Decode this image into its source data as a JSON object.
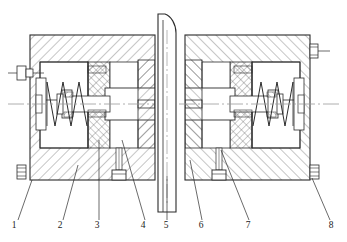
{
  "drawing": {
    "type": "mechanical-cross-section",
    "title": "",
    "width": 347,
    "height": 242,
    "background_color": "#ffffff",
    "line_color": "#2b2b2b",
    "hatch_color": "#555555",
    "centerline_color": "#9a9a9a",
    "description": "Symmetric double-acting clamping/brake mechanism cross-section with central vertical shaft, two mirrored spring-loaded piston assemblies inside a hatched housing body, corner bolt fasteners and bottom screw fasteners.",
    "symmetry": "left-right mirrored about vertical shaft",
    "body": {
      "left_block": {
        "x": 30,
        "y": 35,
        "width": 125,
        "height": 145
      },
      "right_block": {
        "x": 185,
        "y": 35,
        "width": 125,
        "height": 145
      }
    },
    "shaft": {
      "name": "central-vertical-shaft",
      "x_left": 157,
      "x_right": 176,
      "y_top": 14,
      "y_bottom": 212
    },
    "centerline": {
      "name": "horizontal-axis-centerline",
      "y": 104,
      "x_start": 8,
      "x_end": 339
    }
  },
  "callouts": [
    {
      "id": "1",
      "label": "1",
      "label_x": 14,
      "label_y": 228,
      "leader_from_x": 18,
      "leader_from_y": 220,
      "leader_to_x": 32,
      "leader_to_y": 180
    },
    {
      "id": "2",
      "label": "2",
      "label_x": 60,
      "label_y": 228,
      "leader_from_x": 63,
      "leader_from_y": 220,
      "leader_to_x": 78,
      "leader_to_y": 165
    },
    {
      "id": "3",
      "label": "3",
      "label_x": 97,
      "label_y": 228,
      "leader_from_x": 99,
      "leader_from_y": 220,
      "leader_to_x": 99,
      "leader_to_y": 140
    },
    {
      "id": "4",
      "label": "4",
      "label_x": 143,
      "label_y": 228,
      "leader_from_x": 145,
      "leader_from_y": 220,
      "leader_to_x": 122,
      "leader_to_y": 140
    },
    {
      "id": "5",
      "label": "5",
      "label_x": 166,
      "label_y": 228,
      "leader_from_x": 167,
      "leader_from_y": 220,
      "leader_to_x": 167,
      "leader_to_y": 176
    },
    {
      "id": "6",
      "label": "6",
      "label_x": 201,
      "label_y": 228,
      "leader_from_x": 202,
      "leader_from_y": 220,
      "leader_to_x": 190,
      "leader_to_y": 160
    },
    {
      "id": "7",
      "label": "7",
      "label_x": 248,
      "label_y": 228,
      "leader_from_x": 249,
      "leader_from_y": 220,
      "leader_to_x": 221,
      "leader_to_y": 150
    },
    {
      "id": "8",
      "label": "8",
      "label_x": 331,
      "label_y": 228,
      "leader_from_x": 330,
      "leader_from_y": 220,
      "leader_to_x": 312,
      "leader_to_y": 178
    }
  ],
  "fasteners": {
    "corner_bolts": [
      {
        "name": "bolt-left-upper",
        "x": 14,
        "y": 74
      },
      {
        "name": "bolt-left-lower",
        "x": 14,
        "y": 172
      },
      {
        "name": "bolt-right-upper",
        "x": 318,
        "y": 74
      },
      {
        "name": "bolt-right-lower",
        "x": 318,
        "y": 172
      }
    ],
    "bottom_screws": [
      {
        "name": "screw-left-bottom",
        "x": 119,
        "y": 175
      },
      {
        "name": "screw-right-bottom",
        "x": 219,
        "y": 175
      }
    ]
  },
  "springs": [
    {
      "name": "spring-left",
      "x_start": 47,
      "x_end": 80,
      "center_y": 104,
      "amplitude": 22,
      "coils": 4
    },
    {
      "name": "spring-right",
      "x_start": 260,
      "x_end": 293,
      "center_y": 104,
      "amplitude": 22,
      "coils": 4
    }
  ]
}
